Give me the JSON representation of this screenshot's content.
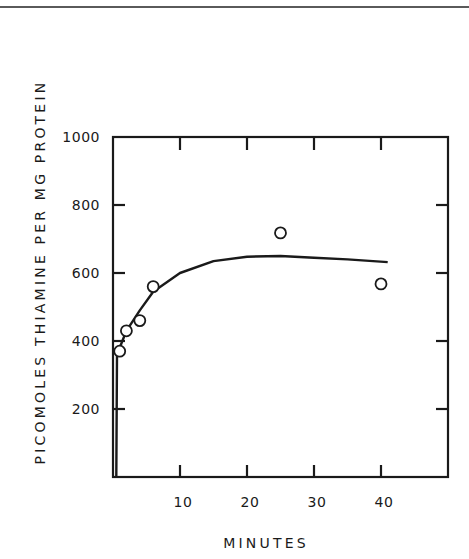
{
  "chart_data": {
    "type": "scatter",
    "title": "",
    "xlabel": "MINUTES",
    "ylabel": "PICOMOLES THIAMINE PER MG PROTEIN",
    "xlim": [
      0,
      50
    ],
    "ylim": [
      0,
      1000
    ],
    "x_ticks": [
      10,
      20,
      30,
      40
    ],
    "x_tick_labels": [
      "10",
      "20",
      "30",
      "40"
    ],
    "y_ticks": [
      200,
      400,
      600,
      800,
      1000
    ],
    "y_tick_labels": [
      "200",
      "400",
      "600",
      "800",
      "1000"
    ],
    "grid": false,
    "legend": null,
    "series": [
      {
        "name": "observed",
        "marker": "open-circle",
        "x": [
          1,
          2,
          4,
          6,
          25,
          40
        ],
        "y": [
          370,
          430,
          460,
          560,
          718,
          568
        ]
      },
      {
        "name": "fitted curve",
        "style": "line",
        "x": [
          0.5,
          0.6,
          1,
          2,
          4,
          6,
          10,
          15,
          20,
          25,
          30,
          35,
          41
        ],
        "y": [
          0,
          360,
          380,
          430,
          490,
          545,
          600,
          635,
          648,
          650,
          645,
          640,
          632
        ]
      }
    ]
  }
}
